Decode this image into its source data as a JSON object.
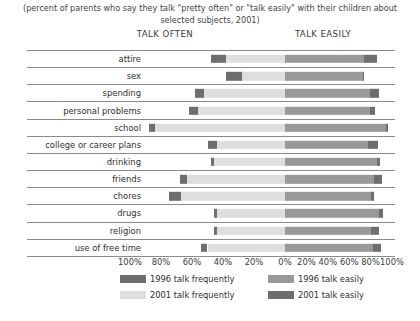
{
  "subtitle": "(percent of parents who say they talk \"pretty often\" or \"talk easily\" with their children about selected subjects, 2001)",
  "headers": {
    "left": "TALK OFTEN",
    "right": "TALK EASILY"
  },
  "axis": {
    "ticks": [
      "100%",
      "80%",
      "60%",
      "40%",
      "20%",
      "0%",
      "20%",
      "40%",
      "60%",
      "80%",
      "100%"
    ]
  },
  "legend": [
    {
      "label": "1996 talk frequently",
      "color": "#6e6e6e"
    },
    {
      "label": "2001 talk frequently",
      "color": "#dedede"
    },
    {
      "label": "1996 talk easily",
      "color": "#999999"
    },
    {
      "label": "2001 talk easily",
      "color": "#6e6e6e"
    }
  ],
  "colors": {
    "left_1996": "#6e6e6e",
    "left_2001": "#dedede",
    "right_1996": "#999999",
    "right_2001": "#6e6e6e",
    "rule": "#8a8a8a",
    "text": "#2e2e2e"
  },
  "chart_data": {
    "type": "bar",
    "orientation": "horizontal-diverging",
    "title": "",
    "subtitle": "(percent of parents who say they talk \"pretty often\" or \"talk easily\" with their children about selected subjects, 2001)",
    "xlabel": "",
    "ylabel": "",
    "xlim_left": [
      0,
      100
    ],
    "xlim_right": [
      0,
      100
    ],
    "xticks": [
      "100%",
      "80%",
      "60%",
      "40%",
      "20%",
      "0%",
      "20%",
      "40%",
      "60%",
      "80%",
      "100%"
    ],
    "grid": false,
    "legend_position": "bottom",
    "left_panel_name": "TALK OFTEN",
    "right_panel_name": "TALK EASILY",
    "categories": [
      "attire",
      "sex",
      "spending",
      "personal problems",
      "school",
      "college or career plans",
      "drinking",
      "friends",
      "chores",
      "drugs",
      "religion",
      "use of free time"
    ],
    "series": [
      {
        "name": "1996 talk frequently",
        "panel": "left",
        "values": [
          48,
          38,
          58,
          62,
          88,
          50,
          48,
          68,
          75,
          46,
          46,
          54
        ]
      },
      {
        "name": "2001 talk frequently",
        "panel": "left",
        "values": [
          38,
          28,
          52,
          56,
          84,
          44,
          46,
          63,
          67,
          44,
          44,
          50
        ]
      },
      {
        "name": "1996 talk easily",
        "panel": "right",
        "values": [
          86,
          73,
          88,
          84,
          96,
          87,
          89,
          91,
          83,
          92,
          88,
          90
        ]
      },
      {
        "name": "2001 talk easily",
        "panel": "right",
        "values": [
          74,
          73,
          79,
          79,
          94,
          78,
          86,
          83,
          80,
          88,
          80,
          82
        ]
      }
    ]
  },
  "rows": [
    {
      "label": "attire",
      "l1996": 48,
      "l2001": 38,
      "r1996": 86,
      "r2001": 74
    },
    {
      "label": "sex",
      "l1996": 38,
      "l2001": 28,
      "r1996": 73,
      "r2001": 73
    },
    {
      "label": "spending",
      "l1996": 58,
      "l2001": 52,
      "r1996": 88,
      "r2001": 79
    },
    {
      "label": "personal problems",
      "l1996": 62,
      "l2001": 56,
      "r1996": 84,
      "r2001": 79
    },
    {
      "label": "school",
      "l1996": 88,
      "l2001": 84,
      "r1996": 96,
      "r2001": 94
    },
    {
      "label": "college or career plans",
      "l1996": 50,
      "l2001": 44,
      "r1996": 87,
      "r2001": 78
    },
    {
      "label": "drinking",
      "l1996": 48,
      "l2001": 46,
      "r1996": 89,
      "r2001": 86
    },
    {
      "label": "friends",
      "l1996": 68,
      "l2001": 63,
      "r1996": 91,
      "r2001": 83
    },
    {
      "label": "chores",
      "l1996": 75,
      "l2001": 67,
      "r1996": 83,
      "r2001": 80
    },
    {
      "label": "drugs",
      "l1996": 46,
      "l2001": 44,
      "r1996": 92,
      "r2001": 88
    },
    {
      "label": "religion",
      "l1996": 46,
      "l2001": 44,
      "r1996": 88,
      "r2001": 80
    },
    {
      "label": "use of free time",
      "l1996": 54,
      "l2001": 50,
      "r1996": 90,
      "r2001": 82
    }
  ]
}
